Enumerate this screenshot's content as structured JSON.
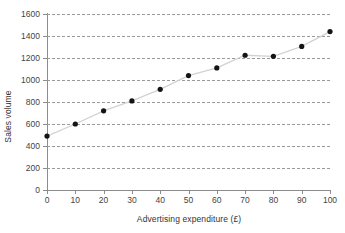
{
  "chart_data": {
    "type": "scatter",
    "title": "",
    "xlabel": "Advertising expenditure (£)",
    "ylabel": "Sales volume",
    "x": [
      0,
      10,
      20,
      30,
      40,
      50,
      60,
      70,
      80,
      90,
      100
    ],
    "values": [
      490,
      600,
      720,
      810,
      915,
      1040,
      1110,
      1225,
      1215,
      1305,
      1440
    ],
    "series": [
      {
        "name": "Sales volume",
        "values": [
          490,
          600,
          720,
          810,
          915,
          1040,
          1110,
          1225,
          1215,
          1305,
          1440
        ]
      }
    ],
    "xlim": [
      0,
      100
    ],
    "ylim": [
      0,
      1600
    ],
    "xticks": [
      0,
      10,
      20,
      30,
      40,
      50,
      60,
      70,
      80,
      90,
      100
    ],
    "yticks": [
      0,
      200,
      400,
      600,
      800,
      1000,
      1200,
      1400,
      1600
    ],
    "xtick_labels": [
      "0",
      "10",
      "20",
      "30",
      "40",
      "50",
      "60",
      "70",
      "80",
      "90",
      "100"
    ],
    "ytick_labels": [
      "0",
      "200",
      "400",
      "600",
      "800",
      "1000",
      "1200",
      "1400",
      "1600"
    ],
    "grid": true,
    "grid_axis": "y",
    "grid_style": "dashed",
    "legend": false,
    "legend_position": "none",
    "connected": true,
    "marker": "circle",
    "marker_color": "#141414",
    "line_color": "#d2d2d2",
    "grid_color": "#9a9a9a",
    "axis_color": "#8c8c8c",
    "background": "#ffffff",
    "annotations": []
  }
}
